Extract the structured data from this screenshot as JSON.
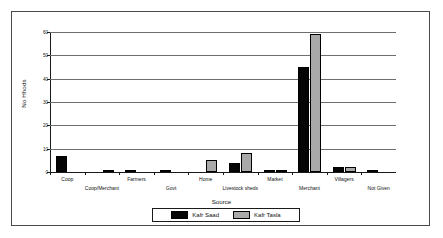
{
  "chart_data": {
    "type": "bar",
    "title": "",
    "xlabel": "Source",
    "ylabel": "No Hhods",
    "ylim": [
      0,
      60
    ],
    "yticks": [
      0,
      10,
      20,
      30,
      40,
      50,
      60
    ],
    "grid": true,
    "legend_position": "bottom",
    "categories": [
      "Coop",
      "Coop/Merchant",
      "Farmers",
      "Govt",
      "Home",
      "Livestock sheds",
      "Market",
      "Merchant",
      "Villagers",
      "Not Given"
    ],
    "series": [
      {
        "name": "Kafr Saad",
        "color": "#050505",
        "values": [
          7,
          0,
          1,
          1,
          0,
          4,
          1,
          45,
          2,
          1
        ]
      },
      {
        "name": "Kafr Tasla",
        "color": "#a9a9a9",
        "values": [
          0,
          1,
          0,
          0,
          5,
          8,
          1,
          59,
          2,
          0
        ]
      }
    ]
  }
}
